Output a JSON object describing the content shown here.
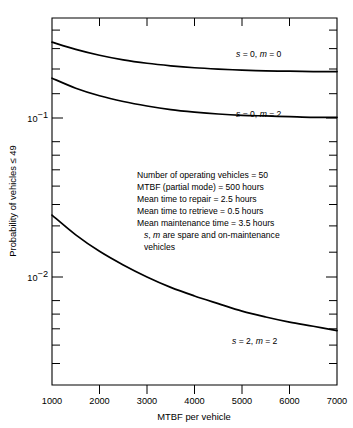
{
  "chart_data": {
    "type": "line",
    "title": "",
    "xlabel": "MTBF per vehicle",
    "ylabel": "Probability of vehicles ≤ 49",
    "xscale": "linear",
    "yscale": "log",
    "xlim": [
      1000,
      7000
    ],
    "ylim": [
      0.004,
      0.45
    ],
    "grid": false,
    "legend_position": "inline-right",
    "xticks": [
      1000,
      2000,
      3000,
      4000,
      5000,
      6000,
      7000
    ],
    "xtick_labels": [
      "1000",
      "2000",
      "3000",
      "4000",
      "5000",
      "6000",
      "7000"
    ],
    "yticks": [
      0.1,
      0.01
    ],
    "ytick_labels": [
      "10⁻¹",
      "10⁻²"
    ],
    "ytick_label_parts": [
      {
        "base": "10",
        "exp": "−1",
        "value": 0.1
      },
      {
        "base": "10",
        "exp": "−2",
        "value": 0.01
      }
    ],
    "series": [
      {
        "name": "s = 0, m = 0",
        "label_s": "s",
        "label_m": "m",
        "label_text": "s = 0, m = 0",
        "x": [
          1000,
          1500,
          2000,
          2500,
          3000,
          3500,
          4000,
          4500,
          5000,
          5500,
          6000,
          6500,
          7000
        ],
        "values": [
          0.3,
          0.27,
          0.248,
          0.232,
          0.221,
          0.213,
          0.207,
          0.203,
          0.2,
          0.198,
          0.197,
          0.196,
          0.196
        ]
      },
      {
        "name": "s = 0, m = 2",
        "label_s": "s",
        "label_m": "m",
        "label_text": "s = 0, m = 2",
        "x": [
          1000,
          1500,
          2000,
          2500,
          3000,
          3500,
          4000,
          4500,
          5000,
          5500,
          6000,
          6500,
          7000
        ],
        "values": [
          0.178,
          0.154,
          0.138,
          0.127,
          0.119,
          0.113,
          0.109,
          0.106,
          0.104,
          0.103,
          0.102,
          0.101,
          0.101
        ]
      },
      {
        "name": "s = 2, m = 2",
        "label_s": "s",
        "label_m": "m",
        "label_text": "s = 2, m = 2",
        "x": [
          1000,
          1500,
          2000,
          2500,
          3000,
          3500,
          4000,
          4500,
          5000,
          5500,
          6000,
          6500,
          7000
        ],
        "values": [
          0.0245,
          0.0184,
          0.0145,
          0.0119,
          0.01,
          0.0086,
          0.0076,
          0.0068,
          0.0061,
          0.0056,
          0.0052,
          0.0049,
          0.0046
        ]
      }
    ],
    "annotations": [
      "Number of operating vehicles = 50",
      "MTBF (partial mode) = 500 hours",
      "Mean time to repair = 2.5 hours",
      "Mean time to retrieve = 0.5 hours",
      "Mean maintenance time = 3.5 hours"
    ],
    "annotation_italic_line": {
      "s": "s",
      "m": "m",
      "text": "s, m are spare and on-maintenance",
      "continuation": "vehicles"
    },
    "colors": {
      "curve": "#000000",
      "axis": "#000000",
      "background": "#ffffff"
    }
  }
}
